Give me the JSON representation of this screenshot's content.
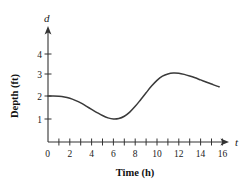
{
  "chart_data": {
    "type": "line",
    "title": "",
    "xlabel": "Time (h)",
    "ylabel": "Depth (ft)",
    "x_axis_variable": "t",
    "y_axis_variable": "d",
    "xlim": [
      0,
      16.8
    ],
    "ylim": [
      0,
      4.6
    ],
    "grid": false,
    "legend": "none",
    "x_tick_labels": [
      "0",
      "2",
      "4",
      "6",
      "8",
      "10",
      "12",
      "14",
      "16"
    ],
    "x_tick_values": [
      0,
      2,
      4,
      6,
      8,
      10,
      12,
      14,
      16
    ],
    "x_minor_tick_values": [
      1,
      2,
      3,
      4,
      5,
      6,
      7,
      8,
      9,
      10,
      11,
      12,
      13,
      14,
      15,
      16
    ],
    "y_tick_labels": [
      "1",
      "2",
      "3",
      "4"
    ],
    "y_tick_values": [
      1,
      2,
      3,
      4
    ],
    "series": [
      {
        "name": "depth",
        "color": "#3a3a3a",
        "x": [
          0.0,
          0.5,
          1.0,
          1.5,
          2.0,
          2.5,
          3.0,
          3.5,
          4.0,
          4.5,
          5.0,
          5.5,
          6.0,
          6.5,
          7.0,
          7.5,
          8.0,
          8.5,
          9.0,
          9.5,
          10.0,
          10.5,
          11.0,
          11.5,
          12.0,
          12.5,
          13.0,
          13.5,
          14.0,
          14.5,
          15.0,
          15.5,
          15.7
        ],
        "y": [
          2.0,
          2.0,
          1.99,
          1.96,
          1.9,
          1.81,
          1.7,
          1.56,
          1.42,
          1.28,
          1.15,
          1.05,
          1.0,
          1.02,
          1.12,
          1.3,
          1.55,
          1.84,
          2.14,
          2.43,
          2.68,
          2.86,
          2.96,
          3.0,
          2.99,
          2.94,
          2.87,
          2.79,
          2.7,
          2.61,
          2.52,
          2.43,
          2.4
        ]
      }
    ]
  },
  "annotations": {
    "y_axis_arrow": "arrow-up",
    "x_axis_arrow": "arrow-right"
  },
  "colors": {
    "curve": "#3a3a3a",
    "axis": "#333333",
    "text": "#1a1a1a",
    "background": "#ffffff"
  }
}
